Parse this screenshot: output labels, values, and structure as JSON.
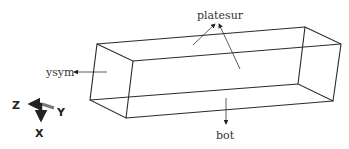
{
  "diagram": {
    "type": "3d-box-boundary-labels",
    "labels": {
      "top": "platesur",
      "left": "ysym",
      "bottom": "bot"
    },
    "axes": {
      "x": "X",
      "y": "Y",
      "z": "Z"
    },
    "colors": {
      "edge": "#2a2a2a",
      "text": "#333333",
      "axis_arrow": "#333333",
      "axis_y_arrow": "#777777"
    }
  }
}
